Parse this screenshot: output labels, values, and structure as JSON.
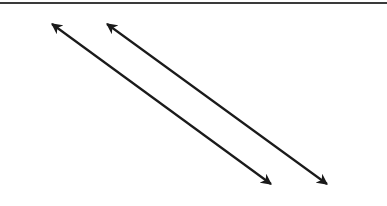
{
  "diagram": {
    "top_rule": {
      "color": "#3a3a3a"
    },
    "arrows": [
      {
        "name": "double-arrow-1",
        "x1": 52,
        "y1": 24,
        "x2": 271,
        "y2": 184,
        "color": "#1a1a1a"
      },
      {
        "name": "double-arrow-2",
        "x1": 107,
        "y1": 24,
        "x2": 327,
        "y2": 184,
        "color": "#1a1a1a"
      }
    ]
  }
}
